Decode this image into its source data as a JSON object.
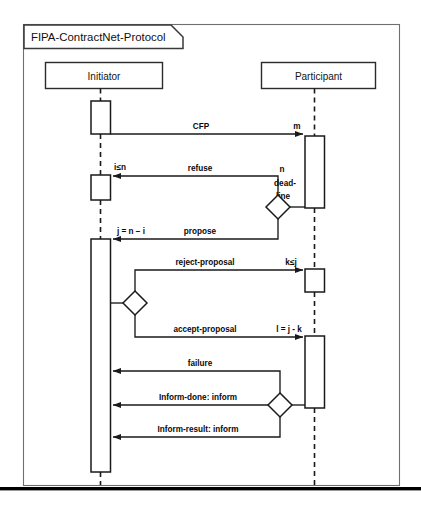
{
  "frame": {
    "title": "FIPA-ContractNet-Protocol"
  },
  "actors": [
    {
      "name": "Initiator",
      "key": "initiator"
    },
    {
      "name": "Participant",
      "key": "participant"
    }
  ],
  "messages": [
    {
      "id": "cfp",
      "label": "CFP",
      "guard": "m",
      "from": "initiator",
      "to": "participant"
    },
    {
      "id": "refuse",
      "label": "refuse",
      "guard": "i≤n",
      "from": "participant",
      "to": "initiator"
    },
    {
      "id": "propose",
      "label": "propose",
      "guard": "j = n − i",
      "from": "participant",
      "to": "initiator"
    },
    {
      "id": "reject-proposal",
      "label": "reject-proposal",
      "guard": "k≤j",
      "from": "initiator",
      "to": "participant"
    },
    {
      "id": "accept-proposal",
      "label": "accept-proposal",
      "guard": "l = j - k",
      "from": "initiator",
      "to": "participant"
    },
    {
      "id": "failure",
      "label": "failure",
      "guard": "",
      "from": "participant",
      "to": "initiator"
    },
    {
      "id": "inform-done",
      "label": "Inform-done: inform",
      "guard": "",
      "from": "participant",
      "to": "initiator"
    },
    {
      "id": "inform-result",
      "label": "Inform-result: inform",
      "guard": "",
      "from": "participant",
      "to": "initiator"
    }
  ],
  "annotations": {
    "deadline_line1": "n",
    "deadline_line2": "dead-",
    "deadline_line3": "line"
  },
  "colors": {
    "stroke": "#1a1a1a",
    "frame_stroke": "#6f6f6f",
    "background": "#ffffff",
    "text": "#101010",
    "footer_bar": "#000000"
  }
}
